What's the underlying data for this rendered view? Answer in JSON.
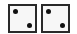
{
  "dice": [
    {
      "value": 2,
      "pips": [
        "top-left",
        "bottom-right"
      ],
      "left": 8
    },
    {
      "value": 2,
      "pips": [
        "top-left",
        "bottom-right"
      ],
      "left": 41
    }
  ],
  "colors": {
    "border": "#2a2a2a",
    "face": "#f7f7f7",
    "pip": "#111111"
  }
}
